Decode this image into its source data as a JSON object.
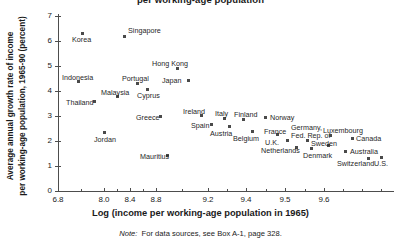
{
  "chart_data": {
    "type": "scatter",
    "title": "per working-age population",
    "xlabel": "Log (income per working-age population in 1965)",
    "ylabel_line1": "Average annual growth rate of income",
    "ylabel_line2": "per working-age population, 1965-90 (percent)",
    "note_prefix": "Note:",
    "note_text": "For data sources, see Box A-1, page 328.",
    "ylim": [
      0,
      7
    ],
    "yticks": [
      0,
      1,
      2,
      3,
      4,
      5,
      6,
      7
    ],
    "xtick_labels": [
      "6.8",
      "8.0",
      "8.4",
      "8.8",
      "9.2",
      "9.4",
      "9.5",
      "9.6"
    ],
    "xtick_px": [
      58,
      104,
      130,
      156,
      208,
      246,
      285,
      324
    ],
    "xminor_px": [
      81,
      117,
      143,
      182,
      227,
      266,
      305,
      343,
      362,
      381
    ],
    "grid": false,
    "legend": "none",
    "marker": "filled-square",
    "points": [
      {
        "name": "Korea",
        "x": 6.9,
        "y": 6.35,
        "px": 82,
        "py": 33,
        "lx": 72,
        "ly": 36,
        "anchor": "below"
      },
      {
        "name": "Singapore",
        "x": 8.2,
        "y": 6.25,
        "px": 124,
        "py": 36,
        "lx": 128,
        "ly": 27,
        "anchor": "above-right"
      },
      {
        "name": "Hong Kong",
        "x": 8.7,
        "y": 4.9,
        "px": 177,
        "py": 68,
        "lx": 152,
        "ly": 60,
        "anchor": "above-left"
      },
      {
        "name": "Indonesia",
        "x": 6.85,
        "y": 4.4,
        "px": 78,
        "py": 81,
        "lx": 62,
        "ly": 74,
        "anchor": "above"
      },
      {
        "name": "Portugal",
        "x": 8.3,
        "y": 4.35,
        "px": 137,
        "py": 83,
        "lx": 122,
        "ly": 75,
        "anchor": "above"
      },
      {
        "name": "Japan",
        "x": 8.75,
        "y": 4.45,
        "px": 188,
        "py": 80,
        "lx": 162,
        "ly": 77,
        "anchor": "left"
      },
      {
        "name": "Cyprus",
        "x": 8.4,
        "y": 4.15,
        "px": 147,
        "py": 89,
        "lx": 137,
        "ly": 92,
        "anchor": "below"
      },
      {
        "name": "Malaysia",
        "x": 8.05,
        "y": 3.88,
        "px": 117,
        "py": 96,
        "lx": 101,
        "ly": 89,
        "anchor": "above"
      },
      {
        "name": "Thailand",
        "x": 6.95,
        "y": 3.7,
        "px": 94,
        "py": 101,
        "lx": 66,
        "ly": 99,
        "anchor": "left"
      },
      {
        "name": "Greece",
        "x": 8.5,
        "y": 3.1,
        "px": 160,
        "py": 116,
        "lx": 136,
        "ly": 114,
        "anchor": "left"
      },
      {
        "name": "Ireland",
        "x": 8.85,
        "y": 3.12,
        "px": 201,
        "py": 115,
        "lx": 183,
        "ly": 108,
        "anchor": "above"
      },
      {
        "name": "Italy",
        "x": 9.12,
        "y": 2.98,
        "px": 224,
        "py": 118,
        "lx": 215,
        "ly": 110,
        "anchor": "above"
      },
      {
        "name": "Finland",
        "x": 9.25,
        "y": 2.93,
        "px": 243,
        "py": 119,
        "lx": 234,
        "ly": 111,
        "anchor": "above"
      },
      {
        "name": "Norway",
        "x": 9.35,
        "y": 3.03,
        "px": 265,
        "py": 117,
        "lx": 270,
        "ly": 114,
        "anchor": "right"
      },
      {
        "name": "Spain",
        "x": 9.0,
        "y": 2.75,
        "px": 211,
        "py": 124,
        "lx": 191,
        "ly": 122,
        "anchor": "left"
      },
      {
        "name": "Austria",
        "x": 9.18,
        "y": 2.68,
        "px": 229,
        "py": 126,
        "lx": 210,
        "ly": 130,
        "anchor": "below-left"
      },
      {
        "name": "Belgium",
        "x": 9.3,
        "y": 2.5,
        "px": 252,
        "py": 131,
        "lx": 233,
        "ly": 135,
        "anchor": "below-left"
      },
      {
        "name": "France",
        "x": 9.4,
        "y": 2.38,
        "px": 277,
        "py": 134,
        "lx": 264,
        "ly": 128,
        "anchor": "above"
      },
      {
        "name": "Germany, Fed. Rep. of",
        "x": 9.48,
        "y": 2.15,
        "px": 307,
        "py": 140,
        "lx": 291,
        "ly": 124,
        "anchor": "above"
      },
      {
        "name": "Luxembourg",
        "x": 9.55,
        "y": 2.35,
        "px": 330,
        "py": 135,
        "lx": 323,
        "ly": 127,
        "anchor": "above"
      },
      {
        "name": "U.K.",
        "x": 9.45,
        "y": 2.15,
        "px": 287,
        "py": 140,
        "lx": 265,
        "ly": 139,
        "anchor": "left"
      },
      {
        "name": "Sweden",
        "x": 9.5,
        "y": 1.95,
        "px": 328,
        "py": 145,
        "lx": 311,
        "ly": 140,
        "anchor": "below-left"
      },
      {
        "name": "Canada",
        "x": 9.58,
        "y": 2.25,
        "px": 352,
        "py": 138,
        "lx": 356,
        "ly": 135,
        "anchor": "right"
      },
      {
        "name": "Netherlands",
        "x": 9.47,
        "y": 1.88,
        "px": 296,
        "py": 147,
        "lx": 261,
        "ly": 147,
        "anchor": "left"
      },
      {
        "name": "Denmark",
        "x": 9.5,
        "y": 1.82,
        "px": 311,
        "py": 148,
        "lx": 303,
        "ly": 152,
        "anchor": "below"
      },
      {
        "name": "Australia",
        "x": 9.56,
        "y": 1.72,
        "px": 345,
        "py": 151,
        "lx": 350,
        "ly": 148,
        "anchor": "right"
      },
      {
        "name": "Switzerland",
        "x": 9.64,
        "y": 1.4,
        "px": 368,
        "py": 158,
        "lx": 337,
        "ly": 160,
        "anchor": "left"
      },
      {
        "name": "U.S.",
        "x": 9.68,
        "y": 1.43,
        "px": 381,
        "py": 157,
        "lx": 374,
        "ly": 160,
        "anchor": "below"
      },
      {
        "name": "Jordan",
        "x": 8.0,
        "y": 2.45,
        "px": 104,
        "py": 132,
        "lx": 94,
        "ly": 136,
        "anchor": "below"
      },
      {
        "name": "Mauritius",
        "x": 8.52,
        "y": 1.52,
        "px": 167,
        "py": 155,
        "lx": 140,
        "ly": 153,
        "anchor": "left"
      }
    ]
  }
}
